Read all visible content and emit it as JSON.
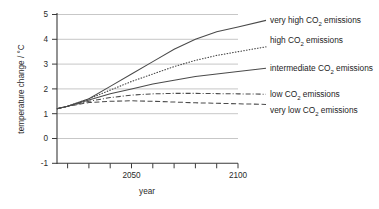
{
  "chart_data": {
    "type": "line",
    "title": "",
    "xlabel": "year",
    "ylabel": "temperature change / °C",
    "xlim": [
      2015,
      2100
    ],
    "ylim": [
      -1,
      5
    ],
    "yticks": [
      -1,
      0,
      1,
      2,
      3,
      4,
      5
    ],
    "xticks": [
      2020,
      2030,
      2040,
      2050,
      2060,
      2070,
      2080,
      2090,
      2100
    ],
    "xtick_labels": [
      "",
      "",
      "",
      "2050",
      "",
      "",
      "",
      "",
      "2100"
    ],
    "grid": "horizontal",
    "legend_position": "right-of-axes-at-line-ends",
    "x": [
      2015,
      2020,
      2030,
      2040,
      2050,
      2060,
      2070,
      2080,
      2090,
      2100
    ],
    "series": [
      {
        "name": "very high CO2 emissions",
        "label_main": "very high CO",
        "label_sub": "2",
        "label_tail": " emissions",
        "style": "solid",
        "values": [
          1.2,
          1.3,
          1.6,
          2.1,
          2.6,
          3.1,
          3.6,
          4.0,
          4.3,
          4.5
        ]
      },
      {
        "name": "high CO2 emissions",
        "label_main": "high CO",
        "label_sub": "2",
        "label_tail": " emissions",
        "style": "dotted",
        "values": [
          1.2,
          1.3,
          1.6,
          1.95,
          2.3,
          2.6,
          2.9,
          3.15,
          3.35,
          3.5
        ]
      },
      {
        "name": "intermediate CO2 emissions",
        "label_main": "intermediate CO",
        "label_sub": "2",
        "label_tail": " emissions",
        "style": "solid",
        "values": [
          1.2,
          1.3,
          1.55,
          1.8,
          2.0,
          2.2,
          2.35,
          2.5,
          2.6,
          2.7
        ]
      },
      {
        "name": "low CO2 emissions",
        "label_main": "low CO",
        "label_sub": "2",
        "label_tail": " emissions",
        "style": "dashdot",
        "values": [
          1.2,
          1.3,
          1.5,
          1.65,
          1.75,
          1.8,
          1.82,
          1.82,
          1.81,
          1.8
        ]
      },
      {
        "name": "very low CO2 emissions",
        "label_main": "very low CO",
        "label_sub": "2",
        "label_tail": " emissions",
        "style": "dashed",
        "values": [
          1.2,
          1.3,
          1.45,
          1.5,
          1.52,
          1.5,
          1.47,
          1.44,
          1.42,
          1.4
        ]
      }
    ]
  },
  "axes": {
    "ylabel": "temperature change / °C",
    "xlabel": "year",
    "ytick_5": "5",
    "ytick_4": "4",
    "ytick_3": "3",
    "ytick_2": "2",
    "ytick_1": "1",
    "ytick_0": "0",
    "ytick_m1": "-1",
    "xtick_2050": "2050",
    "xtick_2100": "2100"
  },
  "legend": {
    "items": [
      {
        "main": "very high CO",
        "sub": "2",
        "tail": " emissions"
      },
      {
        "main": "high CO",
        "sub": "2",
        "tail": " emissions"
      },
      {
        "main": "intermediate CO",
        "sub": "2",
        "tail": " emissions"
      },
      {
        "main": "low CO",
        "sub": "2",
        "tail": " emissions"
      },
      {
        "main": "very low CO",
        "sub": "2",
        "tail": " emissions"
      }
    ]
  }
}
